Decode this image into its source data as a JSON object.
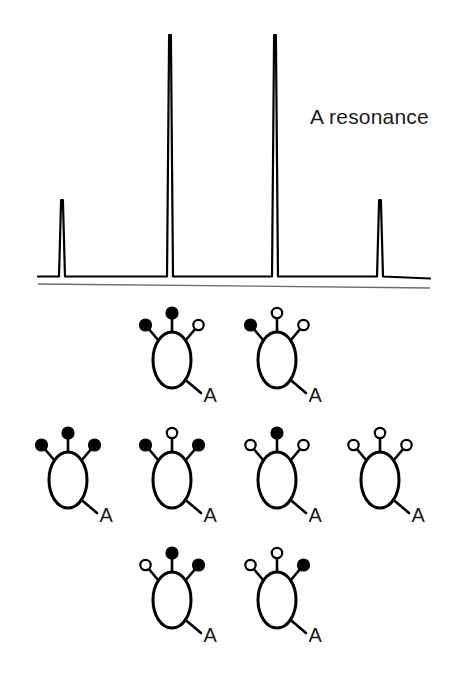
{
  "figure": {
    "background_color": "#ffffff",
    "ink_color": "#000000"
  },
  "spectrum": {
    "annotation_label": "A resonance",
    "annotation_x": 310,
    "annotation_y": 105,
    "baseline_y": 277,
    "second_line_y_left": 284,
    "second_line_y_right": 288,
    "axis_left": 38,
    "axis_right": 430,
    "peak_line_width": 2.2
  },
  "chart_data": {
    "type": "line",
    "title": "A resonance",
    "subtitle": "",
    "xlabel": "",
    "ylabel": "",
    "grid": false,
    "legend_position": "none",
    "x": [
      62,
      170,
      275,
      380
    ],
    "values": [
      1,
      3,
      3,
      1
    ],
    "peak_labels": [
      "1",
      "3",
      "3",
      "1"
    ],
    "peak_pixel_tops": [
      200,
      35,
      35,
      200
    ],
    "baseline_pixel_y": 277,
    "xlim": [
      38,
      430
    ],
    "ylim": [
      0,
      3.3
    ],
    "peaks": [
      {
        "index": 1,
        "x_px": 62,
        "top_px": 200,
        "relative_intensity": 1
      },
      {
        "index": 2,
        "x_px": 170,
        "top_px": 35,
        "relative_intensity": 3
      },
      {
        "index": 3,
        "x_px": 275,
        "top_px": 35,
        "relative_intensity": 3
      },
      {
        "index": 4,
        "x_px": 380,
        "top_px": 200,
        "relative_intensity": 1
      }
    ]
  },
  "spin_diagrams": {
    "nucleus_label": "A",
    "filled_state_name": "alpha",
    "open_state_name": "beta",
    "filled_color": "#000000",
    "open_color": "#ffffff",
    "rows": [
      {
        "row_index": 0,
        "center_y": 360,
        "items": [
          {
            "cx": 172,
            "states": [
              "filled",
              "filled",
              "open"
            ],
            "label": "A"
          },
          {
            "cx": 277,
            "states": [
              "filled",
              "open",
              "open"
            ],
            "label": "A"
          }
        ]
      },
      {
        "row_index": 1,
        "center_y": 480,
        "items": [
          {
            "cx": 68,
            "states": [
              "filled",
              "filled",
              "filled"
            ],
            "label": "A"
          },
          {
            "cx": 172,
            "states": [
              "filled",
              "open",
              "filled"
            ],
            "label": "A"
          },
          {
            "cx": 277,
            "states": [
              "open",
              "filled",
              "open"
            ],
            "label": "A"
          },
          {
            "cx": 380,
            "states": [
              "open",
              "open",
              "open"
            ],
            "label": "A"
          }
        ]
      },
      {
        "row_index": 2,
        "center_y": 600,
        "items": [
          {
            "cx": 172,
            "states": [
              "open",
              "filled",
              "filled"
            ],
            "label": "A"
          },
          {
            "cx": 277,
            "states": [
              "open",
              "open",
              "filled"
            ],
            "label": "A"
          }
        ]
      }
    ]
  }
}
